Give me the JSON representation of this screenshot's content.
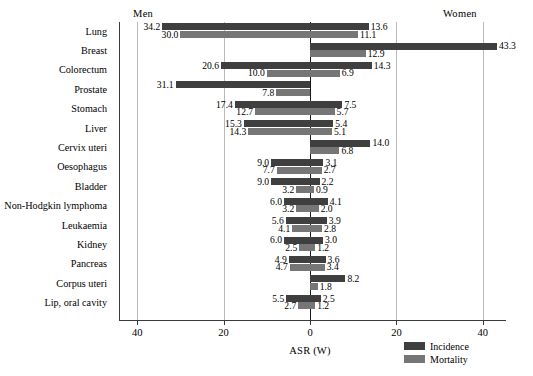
{
  "chart_data": {
    "type": "bar",
    "orientation": "horizontal",
    "subtype": "population-pyramid",
    "title": "",
    "xlabel": "ASR (W)",
    "ylabel": "",
    "panels": [
      {
        "name": "men",
        "label": "Men",
        "side": "left"
      },
      {
        "name": "women",
        "label": "Women",
        "side": "right"
      }
    ],
    "x_ticks": [
      {
        "label": "40",
        "value": -40
      },
      {
        "label": "20",
        "value": -20
      },
      {
        "label": "0",
        "value": 0
      },
      {
        "label": "20",
        "value": 20
      },
      {
        "label": "40",
        "value": 40
      }
    ],
    "xlim": [
      -44.5,
      44.5
    ],
    "grid": true,
    "legend": {
      "position": "bottom-right",
      "entries": [
        {
          "name": "Incidence",
          "color": "#3f3f3f"
        },
        {
          "name": "Mortality",
          "color": "#767676"
        }
      ]
    },
    "series": [
      {
        "name": "Incidence",
        "color": "#3f3f3f"
      },
      {
        "name": "Mortality",
        "color": "#767676"
      }
    ],
    "categories": [
      "Lung",
      "Breast",
      "Colorectum",
      "Prostate",
      "Stomach",
      "Liver",
      "Cervix uteri",
      "Oesophagus",
      "Bladder",
      "Non-Hodgkin lymphoma",
      "Leukaemia",
      "Kidney",
      "Pancreas",
      "Corpus uteri",
      "Lip, oral cavity"
    ],
    "rows": [
      {
        "category": "Lung",
        "men_incidence": 34.2,
        "men_mortality": 30.0,
        "women_incidence": 13.6,
        "women_mortality": 11.1
      },
      {
        "category": "Breast",
        "men_incidence": null,
        "men_mortality": null,
        "women_incidence": 43.3,
        "women_mortality": 12.9
      },
      {
        "category": "Colorectum",
        "men_incidence": 20.6,
        "men_mortality": 10.0,
        "women_incidence": 14.3,
        "women_mortality": 6.9
      },
      {
        "category": "Prostate",
        "men_incidence": 31.1,
        "men_mortality": 7.8,
        "women_incidence": null,
        "women_mortality": null
      },
      {
        "category": "Stomach",
        "men_incidence": 17.4,
        "men_mortality": 12.7,
        "women_incidence": 7.5,
        "women_mortality": 5.7
      },
      {
        "category": "Liver",
        "men_incidence": 15.3,
        "men_mortality": 14.3,
        "women_incidence": 5.4,
        "women_mortality": 5.1
      },
      {
        "category": "Cervix uteri",
        "men_incidence": null,
        "men_mortality": null,
        "women_incidence": 14.0,
        "women_mortality": 6.8
      },
      {
        "category": "Oesophagus",
        "men_incidence": 9.0,
        "men_mortality": 7.7,
        "women_incidence": 3.1,
        "women_mortality": 2.7
      },
      {
        "category": "Bladder",
        "men_incidence": 9.0,
        "men_mortality": 3.2,
        "women_incidence": 2.2,
        "women_mortality": 0.9
      },
      {
        "category": "Non-Hodgkin lymphoma",
        "men_incidence": 6.0,
        "men_mortality": 3.2,
        "women_incidence": 4.1,
        "women_mortality": 2.0
      },
      {
        "category": "Leukaemia",
        "men_incidence": 5.6,
        "men_mortality": 4.1,
        "women_incidence": 3.9,
        "women_mortality": 2.8
      },
      {
        "category": "Kidney",
        "men_incidence": 6.0,
        "men_mortality": 2.5,
        "women_incidence": 3.0,
        "women_mortality": 1.2
      },
      {
        "category": "Pancreas",
        "men_incidence": 4.9,
        "men_mortality": 4.7,
        "women_incidence": 3.6,
        "women_mortality": 3.4
      },
      {
        "category": "Corpus uteri",
        "men_incidence": null,
        "men_mortality": null,
        "women_incidence": 8.2,
        "women_mortality": 1.8
      },
      {
        "category": "Lip, oral cavity",
        "men_incidence": 5.5,
        "men_mortality": 2.7,
        "women_incidence": 2.5,
        "women_mortality": 1.2
      }
    ]
  }
}
